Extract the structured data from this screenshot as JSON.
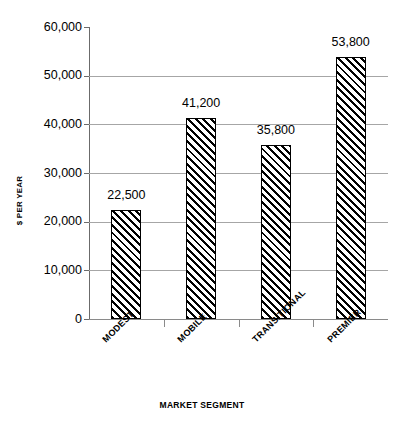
{
  "chart_data": {
    "type": "bar",
    "title": "",
    "categories": [
      "MODEST",
      "MOBILE",
      "TRANSITIONAL",
      "PREMIER"
    ],
    "values": [
      22500,
      41200,
      35800,
      53800
    ],
    "value_labels": [
      "22,500",
      "41,200",
      "35,800",
      "53,800"
    ],
    "xlabel": "MARKET SEGMENT",
    "ylabel": "$ PER YEAR",
    "ylim": [
      0,
      60000
    ],
    "ytick_values": [
      0,
      10000,
      20000,
      30000,
      40000,
      50000,
      60000
    ],
    "ytick_labels": [
      "0",
      "10,000",
      "20,000",
      "30,000",
      "40,000",
      "50,000",
      "60,000"
    ],
    "grid": "horizontal",
    "gridline_values": [
      10000,
      20000,
      30000,
      40000,
      50000
    ],
    "legend": "none",
    "bar_style": "diagonal-hatch",
    "colors": {
      "bar_fill": "#ffffff",
      "bar_hatch": "#000000",
      "bar_border": "#000000",
      "gridline": "#a6a6a6",
      "axis": "#6b6b6b",
      "text": "#000000",
      "background": "#ffffff"
    }
  }
}
